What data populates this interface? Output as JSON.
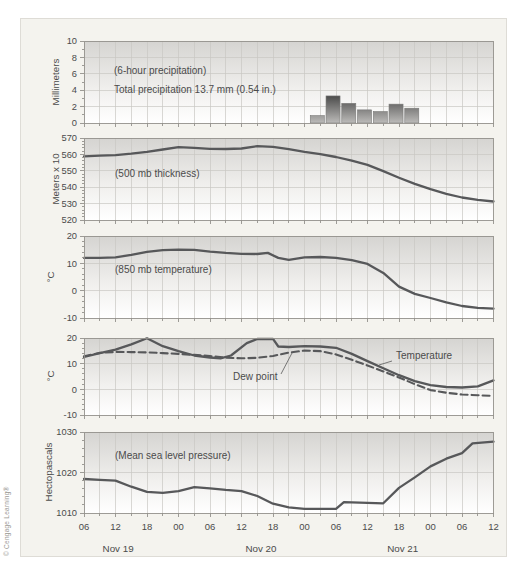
{
  "figure": {
    "copyright": "© Cengage Learning®"
  },
  "colors": {
    "figure_bg": "#f4f3ee",
    "panel_gradient_top": "#d5d4d1",
    "panel_gradient_mid": "#f1f0ee",
    "panel_gradient_bottom": "#ffffff",
    "grid": "#c9c8c3",
    "axis": "#93918c",
    "line": "#57585a",
    "text": "#4b4b4b",
    "bar_dark": "#2f2f2f",
    "bar_light": "#bcbbb9",
    "leader": "#6a6a6a"
  },
  "xaxis": {
    "tick_labels": [
      "06",
      "12",
      "18",
      "00",
      "06",
      "12",
      "18",
      "00",
      "06",
      "12",
      "18",
      "00",
      "06",
      "12"
    ],
    "major_step_hours": 6,
    "minor_step_hours": 3,
    "total_hours": 78,
    "dates": [
      {
        "label": "Nov 19",
        "hour": 6.5
      },
      {
        "label": "Nov 20",
        "hour": 33.7
      },
      {
        "label": "Nov 21",
        "hour": 60.7
      }
    ]
  },
  "chart_data": [
    {
      "type": "bar",
      "name": "6-hour precipitation",
      "ylabel": "Millimeters",
      "ylim": [
        0,
        10
      ],
      "ytick_step": 2,
      "yminor_step": 1,
      "yticks": [
        0,
        2,
        4,
        6,
        8,
        10
      ],
      "annotations": [
        "(6-hour precipitation)",
        "Total precipitation 13.7 mm (0.54 in.)"
      ],
      "total_precipitation_mm": 13.7,
      "total_precipitation_in": 0.54,
      "bars": {
        "width_hours": 2.67,
        "start_hours": [
          43.1,
          46.1,
          49.1,
          52.1,
          55.1,
          58.1,
          61.1
        ],
        "values_mm": [
          0.9,
          3.3,
          2.4,
          1.6,
          1.4,
          2.3,
          1.8
        ]
      }
    },
    {
      "type": "line",
      "name": "500 mb thickness",
      "ylabel": "Meters x 10",
      "ylim": [
        520,
        570
      ],
      "ytick_step": 10,
      "yminor_step": 2,
      "yticks": [
        520,
        530,
        540,
        550,
        560,
        570
      ],
      "annotations": [
        "(500 mb thickness)"
      ],
      "series": [
        {
          "name": "500 mb thickness",
          "style": "solid",
          "points": [
            [
              0,
              558.8
            ],
            [
              3,
              559.2
            ],
            [
              6,
              559.6
            ],
            [
              9,
              560.4
            ],
            [
              12,
              561.6
            ],
            [
              15,
              563.0
            ],
            [
              18,
              564.4
            ],
            [
              21,
              564.0
            ],
            [
              24,
              563.4
            ],
            [
              27,
              563.3
            ],
            [
              30,
              563.6
            ],
            [
              33,
              565.0
            ],
            [
              36,
              564.6
            ],
            [
              39,
              563.2
            ],
            [
              42,
              561.5
            ],
            [
              45,
              560.2
            ],
            [
              48,
              558.4
            ],
            [
              51,
              556.2
            ],
            [
              54,
              553.6
            ],
            [
              57,
              549.8
            ],
            [
              60,
              545.8
            ],
            [
              63,
              542.0
            ],
            [
              66,
              538.8
            ],
            [
              69,
              536.0
            ],
            [
              72,
              533.7
            ],
            [
              75,
              532.3
            ],
            [
              78,
              531.3
            ]
          ]
        }
      ]
    },
    {
      "type": "line",
      "name": "850 mb temperature",
      "ylabel": "°C",
      "ylim": [
        -10,
        20
      ],
      "ytick_step": 10,
      "yminor_step": 2,
      "yticks": [
        -10,
        0,
        10,
        20
      ],
      "annotations": [
        "(850 mb temperature)"
      ],
      "series": [
        {
          "name": "850 mb temperature",
          "style": "solid",
          "points": [
            [
              0,
              12.0
            ],
            [
              3,
              12.0
            ],
            [
              6,
              12.2
            ],
            [
              9,
              13.1
            ],
            [
              12,
              14.2
            ],
            [
              15,
              14.8
            ],
            [
              18,
              15.0
            ],
            [
              21,
              14.9
            ],
            [
              24,
              14.3
            ],
            [
              27,
              13.8
            ],
            [
              30,
              13.5
            ],
            [
              33,
              13.4
            ],
            [
              35,
              13.8
            ],
            [
              37,
              12.0
            ],
            [
              39,
              11.3
            ],
            [
              42,
              12.2
            ],
            [
              45,
              12.3
            ],
            [
              48,
              12.0
            ],
            [
              51,
              11.2
            ],
            [
              54,
              9.8
            ],
            [
              57,
              6.5
            ],
            [
              60,
              1.5
            ],
            [
              63,
              -1.2
            ],
            [
              66,
              -2.7
            ],
            [
              69,
              -4.3
            ],
            [
              72,
              -5.6
            ],
            [
              75,
              -6.3
            ],
            [
              78,
              -6.6
            ]
          ]
        }
      ]
    },
    {
      "type": "line",
      "name": "Temperature and dew point",
      "ylabel": "°C",
      "ylim": [
        -10,
        20
      ],
      "ytick_step": 10,
      "yminor_step": 2,
      "yticks": [
        -10,
        0,
        10,
        20
      ],
      "annotations": [],
      "series_labels": [
        "Temperature",
        "Dew point"
      ],
      "series": [
        {
          "name": "Temperature",
          "style": "solid",
          "points": [
            [
              0,
              12.6
            ],
            [
              3,
              14.1
            ],
            [
              6,
              15.5
            ],
            [
              9,
              17.5
            ],
            [
              12,
              19.9
            ],
            [
              15,
              16.8
            ],
            [
              18,
              14.9
            ],
            [
              21,
              13.2
            ],
            [
              24,
              12.4
            ],
            [
              26,
              12.1
            ],
            [
              28,
              13.2
            ],
            [
              31,
              18.0
            ],
            [
              33,
              19.6
            ],
            [
              36,
              19.7
            ],
            [
              37,
              16.7
            ],
            [
              39,
              16.5
            ],
            [
              42,
              16.8
            ],
            [
              45,
              16.7
            ],
            [
              48,
              16.2
            ],
            [
              51,
              13.8
            ],
            [
              54,
              11.0
            ],
            [
              57,
              8.2
            ],
            [
              60,
              5.5
            ],
            [
              63,
              3.2
            ],
            [
              66,
              1.6
            ],
            [
              69,
              0.9
            ],
            [
              72,
              0.7
            ],
            [
              75,
              1.2
            ],
            [
              78,
              3.5
            ]
          ]
        },
        {
          "name": "Dew point",
          "style": "dashed",
          "points": [
            [
              0,
              12.9
            ],
            [
              3,
              14.2
            ],
            [
              6,
              14.6
            ],
            [
              9,
              14.5
            ],
            [
              12,
              14.4
            ],
            [
              15,
              14.1
            ],
            [
              18,
              13.8
            ],
            [
              21,
              13.4
            ],
            [
              24,
              13.0
            ],
            [
              27,
              12.3
            ],
            [
              30,
              12.1
            ],
            [
              33,
              12.3
            ],
            [
              36,
              13.0
            ],
            [
              39,
              14.3
            ],
            [
              42,
              15.1
            ],
            [
              45,
              14.9
            ],
            [
              48,
              13.6
            ],
            [
              51,
              11.5
            ],
            [
              54,
              9.3
            ],
            [
              57,
              7.0
            ],
            [
              60,
              4.6
            ],
            [
              63,
              2.0
            ],
            [
              66,
              -0.3
            ],
            [
              69,
              -1.3
            ],
            [
              72,
              -2.0
            ],
            [
              75,
              -2.3
            ],
            [
              78,
              -2.6
            ]
          ]
        }
      ]
    },
    {
      "type": "line",
      "name": "Mean sea level pressure",
      "ylabel": "Hectopascals",
      "ylim": [
        1010,
        1030
      ],
      "ytick_step": 10,
      "yminor_step": 2,
      "yticks": [
        1010,
        1020,
        1030
      ],
      "annotations": [
        "(Mean sea level pressure)"
      ],
      "series": [
        {
          "name": "Mean sea level pressure",
          "style": "solid",
          "points": [
            [
              0,
              1018.4
            ],
            [
              3,
              1018.2
            ],
            [
              6,
              1018.0
            ],
            [
              9,
              1016.5
            ],
            [
              12,
              1015.2
            ],
            [
              15,
              1015.0
            ],
            [
              18,
              1015.4
            ],
            [
              21,
              1016.4
            ],
            [
              24,
              1016.1
            ],
            [
              27,
              1015.7
            ],
            [
              30,
              1015.4
            ],
            [
              33,
              1014.2
            ],
            [
              36,
              1012.3
            ],
            [
              39,
              1011.4
            ],
            [
              42,
              1011.0
            ],
            [
              45,
              1011.0
            ],
            [
              48,
              1011.0
            ],
            [
              49.5,
              1012.7
            ],
            [
              54,
              1012.5
            ],
            [
              57,
              1012.4
            ],
            [
              60,
              1016.2
            ],
            [
              63,
              1018.8
            ],
            [
              66,
              1021.5
            ],
            [
              69,
              1023.4
            ],
            [
              72,
              1024.8
            ],
            [
              74,
              1027.2
            ],
            [
              78,
              1027.6
            ]
          ]
        }
      ]
    }
  ]
}
